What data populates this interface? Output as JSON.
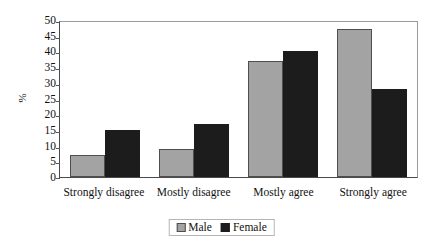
{
  "chart_data": {
    "type": "bar",
    "title": "",
    "xlabel": "",
    "ylabel": "%",
    "ylim": [
      0,
      50
    ],
    "yticks": [
      0,
      5,
      10,
      15,
      20,
      25,
      30,
      35,
      40,
      45,
      50
    ],
    "ytick_labels": [
      "0",
      "5",
      "10",
      "15",
      "20",
      "25",
      "30",
      "35",
      "40",
      "45",
      "50"
    ],
    "grid": false,
    "legend_position": "bottom",
    "categories": [
      "Strongly disagree",
      "Mostly disagree",
      "Mostly agree",
      "Strongly agree"
    ],
    "series": [
      {
        "name": "Male",
        "color": "#a3a3a3",
        "values": [
          7,
          9,
          37,
          47
        ]
      },
      {
        "name": "Female",
        "color": "#1c1c1c",
        "values": [
          15,
          17,
          40,
          28
        ]
      }
    ]
  },
  "legend": {
    "items": [
      {
        "label": "Male",
        "swatch": "male-swatch-icon"
      },
      {
        "label": "Female",
        "swatch": "female-swatch-icon"
      }
    ]
  },
  "colors": {
    "male": "#a3a3a3",
    "female": "#1c1c1c",
    "axis": "#4a4a4a",
    "plot_border": "#9a9a9a",
    "background": "#ffffff",
    "text": "#111111"
  }
}
